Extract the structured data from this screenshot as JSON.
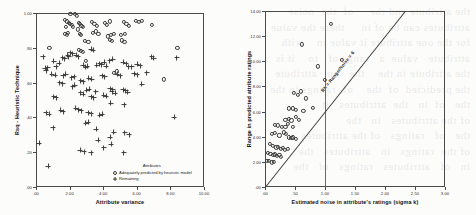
{
  "page": {
    "background_bleed_text": "the attribute and the     of  the  noise\nattributes can be of in     there the value\nfor the one attribute it value in    with\nattribute   value  a   range of   to    it is\nthe attribute in the    the   on   attribute\nthe predicted  of  the    of  ratings in the\nthe   of  in   the  attributes   it\nof the attributes   in   the\nthe   of   ratings   of the attributes\nof the  ratings   in   attributes   the\nin   of   attributes   ratings   of   the",
    "ink_color": "#3c3c3c",
    "paper_color": "#fcfcfb"
  },
  "chart_data": [
    {
      "id": "left",
      "type": "scatter",
      "title": "",
      "xlabel": "Attribute variance",
      "ylabel": "Rsq - Heuristic Technique",
      "xlim": [
        0,
        10
      ],
      "ylim": [
        0,
        1
      ],
      "xticks": [
        0,
        2,
        4,
        6,
        8,
        10
      ],
      "xticklabels": [
        ".00",
        "2.00",
        "4.00",
        "6.00",
        "8.00",
        "10.00"
      ],
      "yticks": [
        0,
        0.2,
        0.4,
        0.6,
        0.8,
        1.0
      ],
      "yticklabels": [
        ".00",
        ".20",
        ".40",
        ".60",
        ".80",
        "1.00"
      ],
      "grid": false,
      "legend": {
        "title": "Attributes",
        "position": "inside-bottom-right",
        "entries": [
          {
            "marker": "circle",
            "label": "Adequately predicted by heuristic model"
          },
          {
            "marker": "plus",
            "label": "Remaining"
          }
        ]
      },
      "series": [
        {
          "name": "Adequately predicted by heuristic model",
          "marker": "circle",
          "points": [
            [
              2.05,
              0.995
            ],
            [
              2.3,
              0.995
            ],
            [
              2.42,
              0.985
            ],
            [
              1.72,
              0.96
            ],
            [
              1.86,
              0.952
            ],
            [
              1.95,
              0.945
            ],
            [
              2.02,
              0.938
            ],
            [
              2.12,
              0.93
            ],
            [
              2.22,
              0.922
            ],
            [
              1.8,
              0.918
            ],
            [
              2.55,
              0.944
            ],
            [
              2.62,
              0.936
            ],
            [
              2.7,
              0.928
            ],
            [
              2.78,
              0.921
            ],
            [
              3.35,
              0.951
            ],
            [
              3.48,
              0.938
            ],
            [
              3.62,
              0.928
            ],
            [
              4.08,
              0.944
            ],
            [
              4.22,
              0.932
            ],
            [
              4.4,
              0.952
            ],
            [
              5.22,
              0.948
            ],
            [
              5.38,
              0.936
            ],
            [
              5.52,
              0.928
            ],
            [
              5.95,
              0.956
            ],
            [
              6.12,
              0.948
            ],
            [
              6.28,
              0.956
            ],
            [
              6.92,
              0.93
            ],
            [
              1.7,
              0.88
            ],
            [
              1.82,
              0.872
            ],
            [
              1.92,
              0.884
            ],
            [
              2.48,
              0.906
            ],
            [
              2.6,
              0.88
            ],
            [
              2.68,
              0.873
            ],
            [
              3.4,
              0.886
            ],
            [
              3.58,
              0.894
            ],
            [
              3.72,
              0.878
            ],
            [
              4.3,
              0.866
            ],
            [
              4.46,
              0.874
            ],
            [
              4.62,
              0.882
            ],
            [
              5.05,
              0.874
            ],
            [
              5.3,
              0.88
            ],
            [
              2.9,
              0.84
            ],
            [
              3.12,
              0.832
            ],
            [
              4.38,
              0.846
            ],
            [
              4.52,
              0.838
            ],
            [
              5.12,
              0.842
            ],
            [
              5.26,
              0.834
            ],
            [
              0.8,
              0.8
            ],
            [
              8.42,
              0.8
            ],
            [
              2.55,
              0.79
            ],
            [
              2.68,
              0.784
            ],
            [
              2.8,
              0.776
            ],
            [
              4.62,
              0.656
            ],
            [
              4.8,
              0.664
            ],
            [
              7.62,
              0.618
            ],
            [
              2.98,
              0.724
            ]
          ]
        },
        {
          "name": "Remaining",
          "marker": "plus",
          "points": [
            [
              0.42,
              0.748
            ],
            [
              0.55,
              0.682
            ],
            [
              0.62,
              0.668
            ],
            [
              0.7,
              0.684
            ],
            [
              1.05,
              0.724
            ],
            [
              1.22,
              0.69
            ],
            [
              1.38,
              0.712
            ],
            [
              1.6,
              0.744
            ],
            [
              1.72,
              0.736
            ],
            [
              1.88,
              0.756
            ],
            [
              1.95,
              0.748
            ],
            [
              2.05,
              0.772
            ],
            [
              2.18,
              0.766
            ],
            [
              2.4,
              0.756
            ],
            [
              2.52,
              0.748
            ],
            [
              2.82,
              0.7
            ],
            [
              2.95,
              0.688
            ],
            [
              3.05,
              0.694
            ],
            [
              3.28,
              0.792
            ],
            [
              3.4,
              0.786
            ],
            [
              3.62,
              0.7
            ],
            [
              3.78,
              0.708
            ],
            [
              3.9,
              0.702
            ],
            [
              4.05,
              0.716
            ],
            [
              4.18,
              0.694
            ],
            [
              4.4,
              0.726
            ],
            [
              4.58,
              0.734
            ],
            [
              5.2,
              0.718
            ],
            [
              5.38,
              0.708
            ],
            [
              5.52,
              0.692
            ],
            [
              5.7,
              0.69
            ],
            [
              6.02,
              0.706
            ],
            [
              6.2,
              0.698
            ],
            [
              6.88,
              0.748
            ],
            [
              7.0,
              0.74
            ],
            [
              8.38,
              0.744
            ],
            [
              0.95,
              0.648
            ],
            [
              1.15,
              0.642
            ],
            [
              1.62,
              0.64
            ],
            [
              1.78,
              0.648
            ],
            [
              2.12,
              0.628
            ],
            [
              2.28,
              0.634
            ],
            [
              2.65,
              0.612
            ],
            [
              2.8,
              0.604
            ],
            [
              3.15,
              0.624
            ],
            [
              3.32,
              0.618
            ],
            [
              3.95,
              0.64
            ],
            [
              4.1,
              0.634
            ],
            [
              4.85,
              0.648
            ],
            [
              5.02,
              0.64
            ],
            [
              5.85,
              0.652
            ],
            [
              6.02,
              0.644
            ],
            [
              6.6,
              0.658
            ],
            [
              1.42,
              0.6
            ],
            [
              1.58,
              0.592
            ],
            [
              2.18,
              0.576
            ],
            [
              2.32,
              0.584
            ],
            [
              3.02,
              0.556
            ],
            [
              3.18,
              0.562
            ],
            [
              3.55,
              0.548
            ],
            [
              4.42,
              0.566
            ],
            [
              4.58,
              0.56
            ],
            [
              5.18,
              0.558
            ],
            [
              5.34,
              0.552
            ],
            [
              6.3,
              0.59
            ],
            [
              1.05,
              0.52
            ],
            [
              1.22,
              0.512
            ],
            [
              2.65,
              0.542
            ],
            [
              2.8,
              0.534
            ],
            [
              3.3,
              0.52
            ],
            [
              3.45,
              0.514
            ],
            [
              4.02,
              0.528
            ],
            [
              4.18,
              0.522
            ],
            [
              4.55,
              0.548
            ],
            [
              4.72,
              0.54
            ],
            [
              5.45,
              0.544
            ],
            [
              0.62,
              0.426
            ],
            [
              0.8,
              0.418
            ],
            [
              1.48,
              0.44
            ],
            [
              1.62,
              0.432
            ],
            [
              2.38,
              0.452
            ],
            [
              2.55,
              0.444
            ],
            [
              2.68,
              0.438
            ],
            [
              3.12,
              0.428
            ],
            [
              3.28,
              0.422
            ],
            [
              3.78,
              0.412
            ],
            [
              3.95,
              0.418
            ],
            [
              4.45,
              0.482
            ],
            [
              5.25,
              0.472
            ],
            [
              8.22,
              0.402
            ],
            [
              1.02,
              0.34
            ],
            [
              2.95,
              0.366
            ],
            [
              3.1,
              0.372
            ],
            [
              3.58,
              0.332
            ],
            [
              4.62,
              0.316
            ],
            [
              5.28,
              0.312
            ],
            [
              0.18,
              0.252
            ],
            [
              3.7,
              0.268
            ],
            [
              4.42,
              0.286
            ],
            [
              5.55,
              0.3
            ],
            [
              2.62,
              0.212
            ],
            [
              2.88,
              0.204
            ],
            [
              3.3,
              0.198
            ],
            [
              4.02,
              0.226
            ],
            [
              4.48,
              0.246
            ],
            [
              5.22,
              0.196
            ],
            [
              0.72,
              0.118
            ]
          ]
        }
      ]
    },
    {
      "id": "right",
      "type": "scatter",
      "title": "",
      "xlabel": "Estimated noise in attribute's ratings (sigma k)",
      "ylabel": "Range in predicted attribute ratings",
      "xlim": [
        0,
        3
      ],
      "ylim": [
        0,
        14
      ],
      "xticks": [
        0,
        0.5,
        1.0,
        1.5,
        2.0,
        2.5,
        3.0
      ],
      "xticklabels": [
        ".00",
        ".50",
        "1.00",
        "1.50",
        "2.00",
        "2.50",
        "3.00"
      ],
      "yticks": [
        0,
        2,
        4,
        6,
        8,
        10,
        12,
        14
      ],
      "yticklabels": [
        ".00",
        "2.00",
        "4.00",
        "6.00",
        "8.00",
        "10.00",
        "12.00",
        "14.00"
      ],
      "grid": false,
      "annotations": [
        {
          "type": "vline",
          "x": 1.0,
          "label": ""
        },
        {
          "type": "line",
          "label": "Rk = Range/Noise = 6",
          "slope": 6,
          "intercept": 0
        }
      ],
      "series": [
        {
          "name": "Attributes",
          "marker": "circle",
          "points": [
            [
              1.1,
              12.95
            ],
            [
              1.28,
              10.1
            ],
            [
              0.62,
              11.35
            ],
            [
              0.88,
              9.6
            ],
            [
              1.0,
              8.55
            ],
            [
              0.48,
              7.5
            ],
            [
              0.55,
              7.3
            ],
            [
              0.6,
              7.6
            ],
            [
              0.68,
              7.05
            ],
            [
              0.8,
              6.3
            ],
            [
              0.4,
              6.25
            ],
            [
              0.46,
              6.25
            ],
            [
              0.52,
              6.15
            ],
            [
              0.64,
              6.05
            ],
            [
              0.34,
              5.35
            ],
            [
              0.4,
              5.4
            ],
            [
              0.44,
              5.3
            ],
            [
              0.52,
              5.55
            ],
            [
              0.56,
              5.35
            ],
            [
              0.16,
              4.95
            ],
            [
              0.22,
              4.9
            ],
            [
              0.28,
              4.75
            ],
            [
              0.34,
              4.8
            ],
            [
              0.38,
              5.05
            ],
            [
              0.46,
              4.75
            ],
            [
              0.12,
              4.25
            ],
            [
              0.17,
              4.3
            ],
            [
              0.24,
              4.1
            ],
            [
              0.31,
              4.35
            ],
            [
              0.35,
              4.2
            ],
            [
              0.4,
              3.95
            ],
            [
              0.44,
              3.9
            ],
            [
              0.47,
              3.95
            ],
            [
              0.52,
              3.85
            ],
            [
              0.08,
              3.4
            ],
            [
              0.13,
              3.3
            ],
            [
              0.19,
              3.15
            ],
            [
              0.22,
              3.2
            ],
            [
              0.26,
              3.05
            ],
            [
              0.3,
              3.1
            ],
            [
              0.33,
              2.95
            ],
            [
              0.38,
              3.05
            ],
            [
              0.05,
              2.7
            ],
            [
              0.09,
              2.65
            ],
            [
              0.14,
              2.55
            ],
            [
              0.17,
              2.6
            ],
            [
              0.2,
              2.45
            ],
            [
              0.24,
              2.55
            ],
            [
              0.27,
              2.4
            ],
            [
              0.03,
              2.1
            ],
            [
              0.07,
              2.05
            ],
            [
              0.11,
              1.95
            ],
            [
              0.15,
              2.0
            ]
          ]
        }
      ]
    }
  ]
}
